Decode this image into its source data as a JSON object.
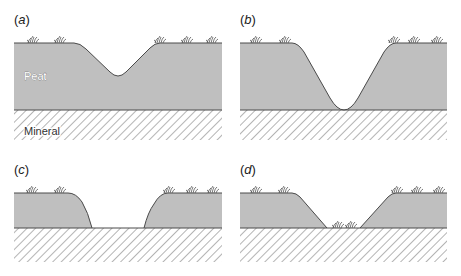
{
  "figure": {
    "colors": {
      "peat_fill": "#bfbfbf",
      "outline": "#4a4a4a",
      "hatch": "#6a6a6a",
      "background": "#ffffff"
    },
    "layers": {
      "peat_label": "Peat",
      "mineral_label": "Mineral"
    },
    "panels": [
      {
        "id": "a",
        "label": "(a)",
        "letter": "a",
        "description": "Shallow V-shaped drain cut into peat"
      },
      {
        "id": "b",
        "label": "(b)",
        "letter": "b",
        "description": "Drain deepened to the mineral boundary"
      },
      {
        "id": "c",
        "label": "(c)",
        "letter": "c",
        "description": "Peat shrunk; flat-bottomed drain on mineral"
      },
      {
        "id": "d",
        "label": "(d)",
        "letter": "d",
        "description": "Wider drain with vegetation on the floor"
      }
    ]
  }
}
